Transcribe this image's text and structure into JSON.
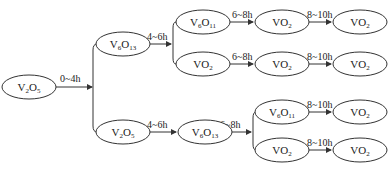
{
  "diagram": {
    "type": "flow",
    "nodes": [
      {
        "id": "n0",
        "label": "V",
        "sub1": "2",
        "mid": "O",
        "sub2": "5",
        "x": 29,
        "y": 87
      },
      {
        "id": "n1",
        "label": "V",
        "sub1": "6",
        "mid": "O",
        "sub2": "13",
        "x": 123,
        "y": 44
      },
      {
        "id": "n2",
        "label": "V",
        "sub1": "6",
        "mid": "O",
        "sub2": "11",
        "x": 203,
        "y": 22
      },
      {
        "id": "n3",
        "label": "VO",
        "sub1": "",
        "mid": "",
        "sub2": "2",
        "x": 203,
        "y": 64
      },
      {
        "id": "n4",
        "label": "VO",
        "sub1": "",
        "mid": "",
        "sub2": "2",
        "x": 282,
        "y": 22
      },
      {
        "id": "n5",
        "label": "VO",
        "sub1": "",
        "mid": "",
        "sub2": "2",
        "x": 360,
        "y": 22
      },
      {
        "id": "n6",
        "label": "VO",
        "sub1": "",
        "mid": "",
        "sub2": "2",
        "x": 282,
        "y": 64
      },
      {
        "id": "n7",
        "label": "VO",
        "sub1": "",
        "mid": "",
        "sub2": "2",
        "x": 360,
        "y": 64
      },
      {
        "id": "n8",
        "label": "V",
        "sub1": "2",
        "mid": "O",
        "sub2": "5",
        "x": 123,
        "y": 132
      },
      {
        "id": "n9",
        "label": "V",
        "sub1": "6",
        "mid": "O",
        "sub2": "13",
        "x": 205,
        "y": 132
      },
      {
        "id": "n10",
        "label": "V",
        "sub1": "6",
        "mid": "O",
        "sub2": "11",
        "x": 282,
        "y": 112
      },
      {
        "id": "n11",
        "label": "VO",
        "sub1": "",
        "mid": "",
        "sub2": "2",
        "x": 282,
        "y": 150
      },
      {
        "id": "n12",
        "label": "VO",
        "sub1": "",
        "mid": "",
        "sub2": "2",
        "x": 360,
        "y": 112
      },
      {
        "id": "n13",
        "label": "VO",
        "sub1": "",
        "mid": "",
        "sub2": "2",
        "x": 360,
        "y": 150
      }
    ],
    "edge_labels": {
      "e0": "0~4h",
      "e1": "4~6h",
      "e2": "6~8h",
      "e3": "6~8h",
      "e4": "8~10h",
      "e5": "8~10h",
      "e6": "4~6h",
      "e7": "6~8h",
      "e8": "8~10h",
      "e9": "8~10h"
    }
  }
}
